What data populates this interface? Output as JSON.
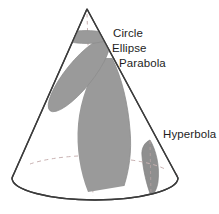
{
  "figure": {
    "background_color": "#ffffff"
  },
  "labels": {
    "circle": "Circle",
    "ellipse": "Ellipse",
    "parabola": "Parabola",
    "hyperbola": "Hyperbola"
  },
  "colors": {
    "outline": "#3b3b3b",
    "section_fill": "#9a9a9a",
    "section_fill_dark": "#8a8a8a",
    "hidden_edge": "#c2a9a9",
    "axis_dash": "#c7b3b3",
    "text": "#1d1d1d"
  },
  "geometry": {
    "apex": {
      "x": 87,
      "y": 9
    },
    "base_center": {
      "x": 95,
      "y": 178
    },
    "base_radius_x": 83,
    "base_radius_y": 22,
    "cone_left_base": {
      "x": 12,
      "y": 178
    },
    "cone_right_base": {
      "x": 178,
      "y": 178
    }
  },
  "sections": [
    {
      "name": "circle",
      "label": "Circle",
      "description": "horizontal cross-section"
    },
    {
      "name": "ellipse",
      "label": "Ellipse",
      "description": "oblique cross-section"
    },
    {
      "name": "parabola",
      "label": "Parabola",
      "description": "cut parallel to a slant side"
    },
    {
      "name": "hyperbola",
      "label": "Hyperbola",
      "description": "near-vertical cut"
    }
  ]
}
